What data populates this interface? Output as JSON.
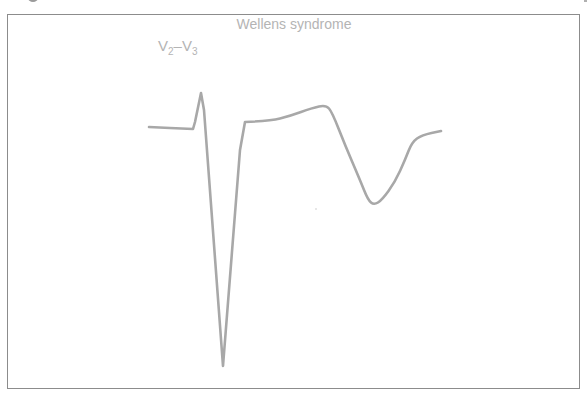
{
  "figure": {
    "title": "Wellens syndrome",
    "lead_label": {
      "lead1_letter": "V",
      "lead1_sub": "2",
      "separator": "–",
      "lead2_letter": "V",
      "lead2_sub": "3"
    },
    "trace_color": "#a8a8a8",
    "frame_color": "#8c8c8c",
    "text_color": "#b4b4b4"
  },
  "waveform": {
    "description": "ECG complex in leads V2-V3 showing deep biphasic T-wave inversion (Wellens pattern)",
    "points": [
      [
        149,
        127
      ],
      [
        170,
        128
      ],
      [
        193,
        129
      ],
      [
        195,
        122
      ],
      [
        201,
        93
      ],
      [
        204,
        110
      ],
      [
        223,
        366
      ],
      [
        240,
        150
      ],
      [
        245,
        122
      ],
      [
        270,
        121
      ],
      [
        290,
        116
      ],
      [
        312,
        108
      ],
      [
        326,
        105
      ],
      [
        332,
        112
      ],
      [
        345,
        145
      ],
      [
        360,
        180
      ],
      [
        368,
        200
      ],
      [
        374,
        205
      ],
      [
        382,
        200
      ],
      [
        395,
        182
      ],
      [
        405,
        160
      ],
      [
        412,
        142
      ],
      [
        422,
        135
      ],
      [
        441,
        131
      ]
    ]
  }
}
